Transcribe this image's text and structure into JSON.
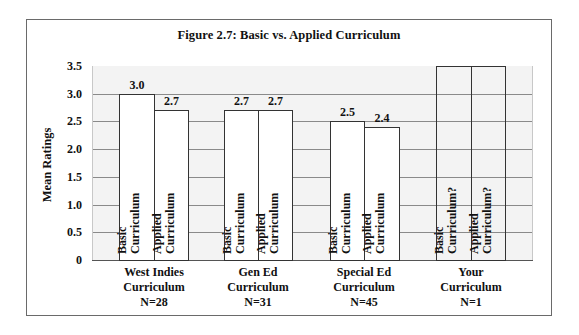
{
  "chart_data": {
    "type": "bar",
    "title": "Figure 2.7: Basic vs. Applied Curriculum",
    "xlabel": "",
    "ylabel": "Mean Ratings",
    "ylim": [
      0,
      3.5
    ],
    "yticks": [
      "0",
      "0.5",
      "1.0",
      "1.5",
      "2.0",
      "2.5",
      "3.0",
      "3.5"
    ],
    "grid": true,
    "legend": null,
    "categories": [
      {
        "lines": [
          "West Indies",
          "Curriculum",
          "N=28"
        ]
      },
      {
        "lines": [
          "Gen Ed",
          "Curriculum",
          "N=31"
        ]
      },
      {
        "lines": [
          "Special Ed",
          "Curriculum",
          "N=45"
        ]
      },
      {
        "lines": [
          "Your",
          "Curriculum",
          "N=1"
        ]
      }
    ],
    "series": [
      {
        "name": "Basic Curriculum",
        "values": [
          3.0,
          2.7,
          2.5,
          null
        ]
      },
      {
        "name": "Applied Curriculum",
        "values": [
          2.7,
          2.7,
          2.4,
          null
        ]
      }
    ],
    "bars": [
      {
        "group": 0,
        "value": 3.0,
        "value_label": "3.0",
        "text": [
          "Basic",
          "Curriculum"
        ]
      },
      {
        "group": 0,
        "value": 2.7,
        "value_label": "2.7",
        "text": [
          "Applied",
          "Curriculum"
        ]
      },
      {
        "group": 1,
        "value": 2.7,
        "value_label": "2.7",
        "text": [
          "Basic",
          "Curriculum"
        ]
      },
      {
        "group": 1,
        "value": 2.7,
        "value_label": "2.7",
        "text": [
          "Applied",
          "Curriculum"
        ]
      },
      {
        "group": 2,
        "value": 2.5,
        "value_label": "2.5",
        "text": [
          "Basic",
          "Curriculum"
        ]
      },
      {
        "group": 2,
        "value": 2.4,
        "value_label": "2.4",
        "text": [
          "Applied",
          "Curriculum"
        ]
      },
      {
        "group": 3,
        "value": 3.5,
        "value_label": "",
        "text": [
          "Basic",
          "Curriculum?"
        ],
        "hollow": true
      },
      {
        "group": 3,
        "value": 3.5,
        "value_label": "",
        "text": [
          "Applied",
          "Curriculum?"
        ],
        "hollow": true
      }
    ],
    "colors": {
      "bar_fill": "#ffffff",
      "bar_border": "#333333",
      "plot_bg": "#f3f3f3",
      "grid": "#8a8a8a"
    }
  }
}
